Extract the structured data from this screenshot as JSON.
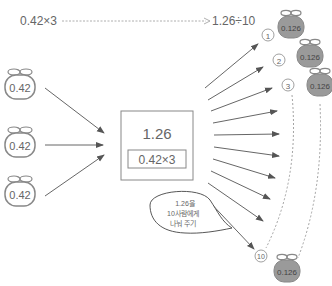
{
  "top_left_expr": "0.42×3",
  "top_right_expr": "1.26÷10",
  "left_bags": [
    {
      "label": "0.42"
    },
    {
      "label": "0.42"
    },
    {
      "label": "0.42"
    }
  ],
  "center_box": {
    "value": "1.26",
    "expression": "0.42×3"
  },
  "markers": {
    "first": "①",
    "second": "②",
    "third": "③",
    "tenth": "⑩"
  },
  "right_bags": [
    {
      "label": "0.126"
    },
    {
      "label": "0.126"
    },
    {
      "label": "0.126"
    },
    {
      "label": "0.126"
    }
  ],
  "speech_bubble": {
    "line1": "1.26을",
    "line2": "10사람에게",
    "line3": "나눠 주기"
  },
  "colors": {
    "outline": "#888888",
    "arrow": "#555555",
    "bag_fill_gray": "#9a9a9a",
    "text": "#666666"
  }
}
